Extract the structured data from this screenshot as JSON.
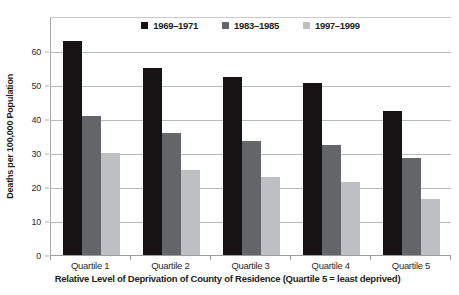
{
  "chart_data": {
    "type": "bar",
    "categories": [
      "Quartile 1",
      "Quartile 2",
      "Quartile 3",
      "Quartile 4",
      "Quartile 5"
    ],
    "series": [
      {
        "name": "1969–1971",
        "color": "#171314",
        "values": [
          63,
          55,
          52.5,
          50.5,
          42.5
        ]
      },
      {
        "name": "1983–1985",
        "color": "#646568",
        "values": [
          41,
          36,
          33.5,
          32.5,
          28.5
        ]
      },
      {
        "name": "1997–1999",
        "color": "#bdbfc1",
        "values": [
          30,
          25,
          23,
          21.5,
          16.5
        ]
      }
    ],
    "xlabel": "Relative Level of Deprivation of County of Residence (Quartile 5 = least deprived)",
    "ylabel": "Deaths per 100,000 Population",
    "ylim": [
      0,
      70
    ],
    "ytick_step": 10,
    "ytick_label_max": 60,
    "grid": true,
    "legend_position": "top-center"
  },
  "colors": {
    "background": "#ffffff",
    "gridline": "#b7b9bb",
    "axis": "#9b9da0",
    "text": "#231f20"
  }
}
